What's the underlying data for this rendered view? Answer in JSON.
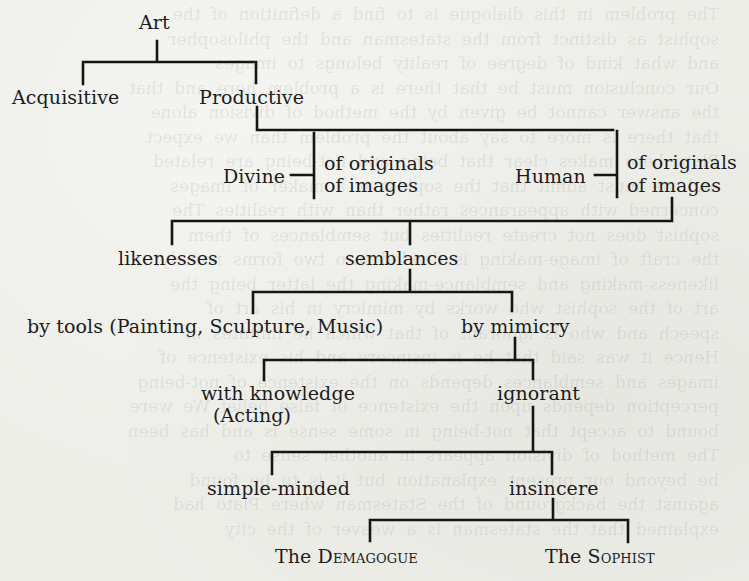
{
  "diagram": {
    "type": "division-tree",
    "root": "Art",
    "nodes": {
      "art": "Art",
      "acquisitive": "Acquisitive",
      "productive": "Productive",
      "divine": "Divine",
      "divine_originals": "of originals",
      "divine_images": "of images",
      "human": "Human",
      "human_originals": "of originals",
      "human_images": "of images",
      "likenesses": "likenesses",
      "semblances": "semblances",
      "by_tools": "by tools (Painting, Sculpture, Music)",
      "by_mimicry": "by mimicry",
      "with_knowledge": "with knowledge",
      "acting": "(Acting)",
      "ignorant": "ignorant",
      "simple_minded": "simple-minded",
      "insincere": "insincere",
      "demagogue_the": "The",
      "demagogue_name": "Demagogue",
      "sophist_the": "The",
      "sophist_name": "Sophist"
    },
    "edges": [
      [
        "Art",
        "Acquisitive"
      ],
      [
        "Art",
        "Productive"
      ],
      [
        "Productive",
        "Divine"
      ],
      [
        "Productive",
        "Human"
      ],
      [
        "Divine",
        "of originals"
      ],
      [
        "Divine",
        "of images"
      ],
      [
        "Human",
        "of originals"
      ],
      [
        "Human",
        "of images"
      ],
      [
        "Human of images",
        "likenesses"
      ],
      [
        "Human of images",
        "semblances"
      ],
      [
        "semblances",
        "by tools (Painting, Sculpture, Music)"
      ],
      [
        "semblances",
        "by mimicry"
      ],
      [
        "by mimicry",
        "with knowledge (Acting)"
      ],
      [
        "by mimicry",
        "ignorant"
      ],
      [
        "ignorant",
        "simple-minded"
      ],
      [
        "ignorant",
        "insincere"
      ],
      [
        "insincere",
        "The Demagogue"
      ],
      [
        "insincere",
        "The Sophist"
      ]
    ],
    "line_color": "#151515",
    "paper_color": "#eeeee9"
  }
}
